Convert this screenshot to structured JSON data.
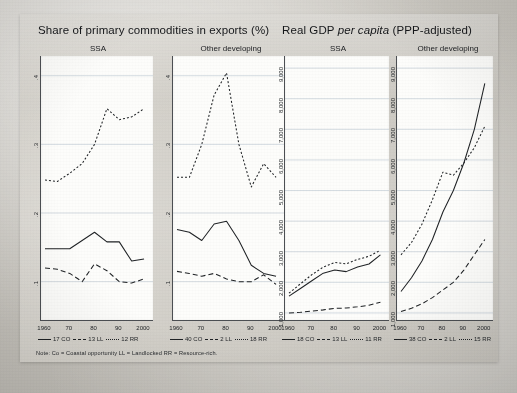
{
  "figure": {
    "note": "Note: Co = Coastal opportunity    LL = Landlocked    RR = Resource-rich.",
    "groups": [
      {
        "id": "share",
        "title_main": "Share of primary commodities in exports (%)",
        "title_italic": "",
        "title_tail": ""
      },
      {
        "id": "gdp",
        "title_main": "Real GDP ",
        "title_italic": "per capita",
        "title_tail": " (PPP-adjusted)"
      }
    ]
  },
  "panels": [
    {
      "key": "share_ssa",
      "title": "SSA",
      "yticks": [
        ".4",
        ".3",
        ".2",
        ".1"
      ],
      "xticks": [
        "1960",
        "70",
        "80",
        "90",
        "2000"
      ],
      "legend": [
        {
          "label": "17 CO",
          "style": "solid"
        },
        {
          "label": "13 LL",
          "style": "dash"
        },
        {
          "label": "12 RR",
          "style": "dot"
        }
      ]
    },
    {
      "key": "share_other",
      "title": "Other developing",
      "yticks": [
        ".4",
        ".3",
        ".2",
        ".1"
      ],
      "xticks": [
        "1960",
        "70",
        "80",
        "90",
        "2000"
      ],
      "legend": [
        {
          "label": "40 CO",
          "style": "solid"
        },
        {
          "label": "2 LL",
          "style": "dash"
        },
        {
          "label": "18 RR",
          "style": "dot"
        }
      ]
    },
    {
      "key": "gdp_ssa",
      "title": "SSA",
      "yticks": [
        "9,000",
        "8,000",
        "7,000",
        "6,000",
        "5,000",
        "4,000",
        "3,000",
        "2,000",
        "1,000"
      ],
      "xticks": [
        "1960",
        "70",
        "80",
        "90",
        "2000"
      ],
      "legend": [
        {
          "label": "18 CO",
          "style": "solid"
        },
        {
          "label": "13 LL",
          "style": "dash"
        },
        {
          "label": "11 RR",
          "style": "dot"
        }
      ]
    },
    {
      "key": "gdp_other",
      "title": "Other developing",
      "yticks": [
        "9,000",
        "8,000",
        "7,000",
        "6,000",
        "5,000",
        "4,000",
        "3,000",
        "2,000",
        "1,000"
      ],
      "xticks": [
        "1960",
        "70",
        "80",
        "90",
        "2000"
      ],
      "legend": [
        {
          "label": "38 CO",
          "style": "solid"
        },
        {
          "label": "2 LL",
          "style": "dash"
        },
        {
          "label": "15 RR",
          "style": "dot"
        }
      ]
    }
  ],
  "chart_data": [
    {
      "type": "line",
      "key": "share_ssa",
      "title": "Share of primary commodities in exports (%) — SSA",
      "xlabel": "",
      "ylabel": "",
      "x": [
        1960,
        1965,
        1970,
        1975,
        1980,
        1985,
        1990,
        1995,
        2000
      ],
      "xlim": [
        1960,
        2002
      ],
      "ylim": [
        0.05,
        0.42
      ],
      "grid": true,
      "series": [
        {
          "name": "17 CO",
          "style": "solid",
          "values": [
            0.148,
            0.148,
            0.148,
            0.16,
            0.172,
            0.158,
            0.158,
            0.13,
            0.133
          ]
        },
        {
          "name": "13 LL",
          "style": "dash",
          "values": [
            0.12,
            0.118,
            0.112,
            0.1,
            0.126,
            0.116,
            0.1,
            0.098,
            0.104
          ]
        },
        {
          "name": "12 RR",
          "style": "dot",
          "values": [
            0.248,
            0.246,
            0.258,
            0.272,
            0.3,
            0.352,
            0.336,
            0.34,
            0.352
          ]
        }
      ]
    },
    {
      "type": "line",
      "key": "share_other",
      "title": "Share of primary commodities in exports (%) — Other developing",
      "xlabel": "",
      "ylabel": "",
      "x": [
        1960,
        1965,
        1970,
        1975,
        1980,
        1985,
        1990,
        1995,
        2000
      ],
      "xlim": [
        1960,
        2002
      ],
      "ylim": [
        0.05,
        0.42
      ],
      "grid": true,
      "series": [
        {
          "name": "40 CO",
          "style": "solid",
          "values": [
            0.176,
            0.172,
            0.16,
            0.184,
            0.188,
            0.16,
            0.124,
            0.112,
            0.108
          ]
        },
        {
          "name": "2 LL",
          "style": "dash",
          "values": [
            0.115,
            0.112,
            0.108,
            0.112,
            0.104,
            0.1,
            0.1,
            0.11,
            0.096
          ]
        },
        {
          "name": "18 RR",
          "style": "dot",
          "values": [
            0.252,
            0.252,
            0.3,
            0.372,
            0.404,
            0.3,
            0.238,
            0.272,
            0.252
          ]
        }
      ]
    },
    {
      "type": "line",
      "key": "gdp_ssa",
      "title": "Real GDP per capita (PPP-adjusted) — SSA",
      "xlabel": "",
      "ylabel": "",
      "x": [
        1960,
        1965,
        1970,
        1975,
        1980,
        1985,
        1990,
        1995,
        2000
      ],
      "xlim": [
        1960,
        2002
      ],
      "ylim": [
        900,
        9200
      ],
      "grid": true,
      "series": [
        {
          "name": "18 CO",
          "style": "solid",
          "values": [
            1550,
            1800,
            2050,
            2300,
            2400,
            2350,
            2500,
            2600,
            2900
          ]
        },
        {
          "name": "13 LL",
          "style": "dash",
          "values": [
            1000,
            1020,
            1060,
            1100,
            1150,
            1160,
            1200,
            1250,
            1350
          ]
        },
        {
          "name": "11 RR",
          "style": "dot",
          "values": [
            1650,
            1950,
            2250,
            2500,
            2650,
            2600,
            2750,
            2850,
            3050
          ]
        }
      ]
    },
    {
      "type": "line",
      "key": "gdp_other",
      "title": "Real GDP per capita (PPP-adjusted) — Other developing",
      "xlabel": "",
      "ylabel": "",
      "x": [
        1960,
        1965,
        1970,
        1975,
        1980,
        1985,
        1990,
        1995,
        2000
      ],
      "xlim": [
        1960,
        2002
      ],
      "ylim": [
        900,
        9200
      ],
      "grid": true,
      "series": [
        {
          "name": "38 CO",
          "style": "solid",
          "values": [
            1700,
            2150,
            2700,
            3400,
            4300,
            5000,
            5900,
            7000,
            8500
          ]
        },
        {
          "name": "2 LL",
          "style": "dash",
          "values": [
            1050,
            1150,
            1300,
            1500,
            1750,
            2000,
            2400,
            2900,
            3400
          ]
        },
        {
          "name": "15 RR",
          "style": "dot",
          "values": [
            2900,
            3300,
            3900,
            4700,
            5600,
            5500,
            5900,
            6400,
            7100
          ]
        }
      ]
    }
  ]
}
